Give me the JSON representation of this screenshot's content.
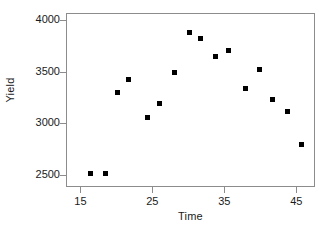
{
  "chart_data": {
    "type": "scatter",
    "title": "",
    "xlabel": "Time",
    "ylabel": "Yield",
    "xlim": [
      13.0,
      47.6
    ],
    "ylim": [
      2380,
      4070
    ],
    "xticks": [
      15,
      25,
      35,
      45
    ],
    "yticks": [
      2500,
      3000,
      3500,
      4000
    ],
    "xtick_labels": [
      "15",
      "25",
      "35",
      "45"
    ],
    "ytick_labels": [
      "2500",
      "3000",
      "3500",
      "4000"
    ],
    "grid": false,
    "legend": null,
    "marker": "filled-square",
    "marker_color": "#000000",
    "frame_color": "#8c8c8c",
    "series": [
      {
        "name": "Yield vs Time",
        "points": [
          {
            "x": 16.3,
            "y": 2520
          },
          {
            "x": 18.3,
            "y": 2525
          },
          {
            "x": 20.0,
            "y": 3305
          },
          {
            "x": 21.6,
            "y": 3430
          },
          {
            "x": 24.2,
            "y": 3060
          },
          {
            "x": 25.8,
            "y": 3200
          },
          {
            "x": 28.0,
            "y": 3505
          },
          {
            "x": 30.0,
            "y": 3890
          },
          {
            "x": 31.6,
            "y": 3830
          },
          {
            "x": 33.6,
            "y": 3655
          },
          {
            "x": 35.5,
            "y": 3715
          },
          {
            "x": 37.8,
            "y": 3350
          },
          {
            "x": 39.8,
            "y": 3530
          },
          {
            "x": 41.6,
            "y": 3235
          },
          {
            "x": 43.6,
            "y": 3120
          },
          {
            "x": 45.6,
            "y": 2800
          }
        ]
      }
    ]
  }
}
